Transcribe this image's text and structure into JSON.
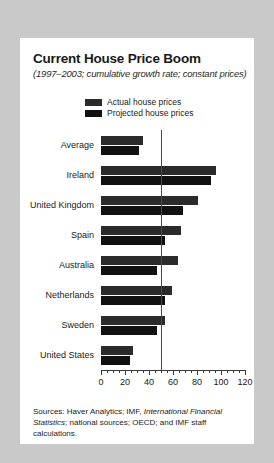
{
  "figure": {
    "title": "Current House Price Boom",
    "subtitle": "(1997–2003; cumulative growth rate; constant prices)",
    "panel_background": "#ffffff",
    "page_background": "#c9c9c9"
  },
  "legend": {
    "position": "top-center",
    "entries": [
      {
        "label": "Actual house prices",
        "color": "#2b2b2b"
      },
      {
        "label": "Projected house prices",
        "color": "#111111"
      }
    ]
  },
  "source": {
    "line1_prefix": "Sources:  Haver Analytics; IMF, ",
    "line1_italic": "International Financial Statistics",
    "line1_suffix": ";",
    "line2": "national sources; OECD;  and IMF staff calculations."
  },
  "chart_data": {
    "type": "bar",
    "orientation": "horizontal",
    "title": "Current House Price Boom",
    "subtitle": "(1997–2003; cumulative growth rate; constant prices)",
    "xlabel": "",
    "ylabel": "",
    "xlim": [
      0,
      120
    ],
    "xticks": [
      0,
      20,
      40,
      60,
      80,
      100,
      120
    ],
    "xtick_labels": [
      "0",
      "20",
      "40",
      "60",
      "80",
      "100",
      "120"
    ],
    "minor_tick_step": 5,
    "grid": false,
    "reference_line": {
      "value": 50,
      "color": "#4a4a4a"
    },
    "categories": [
      "Average",
      "Ireland",
      "United Kingdom",
      "Spain",
      "Australia",
      "Netherlands",
      "Sweden",
      "United States"
    ],
    "series": [
      {
        "name": "Actual house prices",
        "color": "#2b2b2b",
        "values": [
          35,
          96,
          81,
          67,
          64,
          59,
          53,
          27
        ]
      },
      {
        "name": "Projected house prices",
        "color": "#111111",
        "values": [
          32,
          92,
          68,
          53,
          47,
          53,
          47,
          24
        ]
      }
    ]
  }
}
